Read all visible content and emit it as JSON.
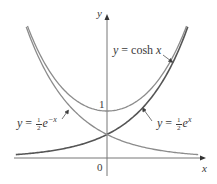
{
  "chart_data": {
    "type": "line",
    "title": "",
    "xlabel": "x",
    "ylabel": "y",
    "x_range": [
      -1.94,
      2.0
    ],
    "y_range": [
      0,
      2.9
    ],
    "y_ticks": [
      {
        "value": 1,
        "label": "1"
      }
    ],
    "origin_label": "0",
    "grid": false,
    "legend": "none (curves annotated with arrowed labels)",
    "series": [
      {
        "name": "y = cosh x",
        "formula": "cosh(x)",
        "color": "#8c8c8c",
        "x": [
          -1.75,
          -1.5,
          -1.0,
          -0.5,
          0,
          0.5,
          1.0,
          1.5,
          1.75
        ],
        "y": [
          2.96,
          2.35,
          1.54,
          1.13,
          1.0,
          1.13,
          1.54,
          2.35,
          2.96
        ]
      },
      {
        "name": "y = ½e^x",
        "formula": "0.5*exp(x)",
        "color": "#555555",
        "x": [
          -1.94,
          -1.5,
          -1.0,
          -0.5,
          0,
          0.5,
          1.0,
          1.5,
          1.75
        ],
        "y": [
          0.07,
          0.11,
          0.18,
          0.3,
          0.5,
          0.82,
          1.36,
          2.24,
          2.88
        ]
      },
      {
        "name": "y = ½e^-x",
        "formula": "0.5*exp(-x)",
        "color": "#8c8c8c",
        "x": [
          -1.75,
          -1.5,
          -1.0,
          -0.5,
          0,
          0.5,
          1.0,
          1.5,
          1.94
        ],
        "y": [
          2.88,
          2.24,
          1.36,
          0.82,
          0.5,
          0.3,
          0.18,
          0.11,
          0.07
        ]
      }
    ],
    "annotations": [
      {
        "text": "y = cosh x",
        "points_to": "cosh curve, right branch"
      },
      {
        "text": "y = ½e^x",
        "points_to": "½e^x curve, right side"
      },
      {
        "text": "y = ½e^-x",
        "points_to": "½e^-x curve, left side"
      }
    ]
  },
  "labels": {
    "y_axis": "y",
    "x_axis": "x",
    "one": "1",
    "zero": "0",
    "cosh": {
      "lhs": "y",
      "eq": " = cosh ",
      "var": "x"
    },
    "half_ex": {
      "lhs": "y",
      "eq": " = ",
      "num": "1",
      "den": "2",
      "base": "e",
      "exp": "x"
    },
    "half_emx": {
      "lhs": "y",
      "eq": " = ",
      "num": "1",
      "den": "2",
      "base": "e",
      "exp": "−x"
    }
  }
}
